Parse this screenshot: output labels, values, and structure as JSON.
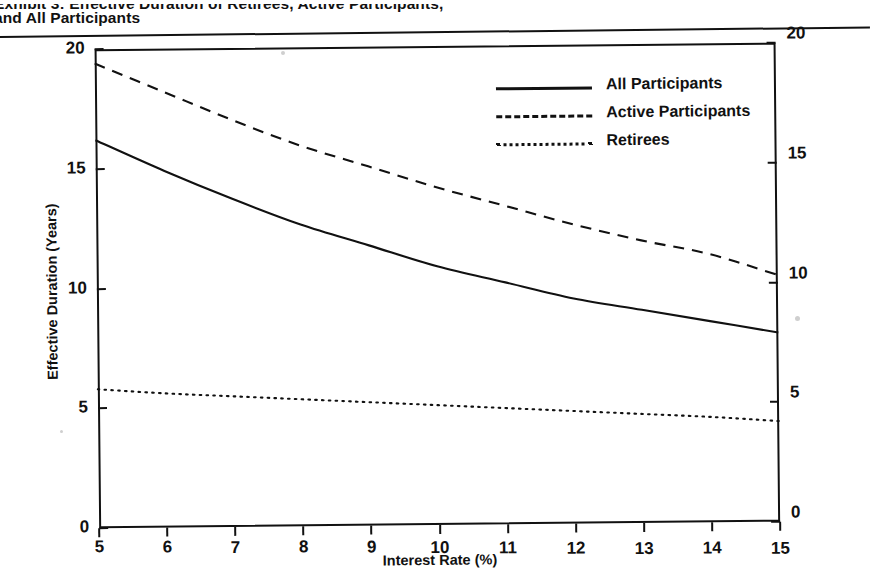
{
  "document": {
    "title_line1": "Exhibit 3: Effective Duration of Retirees, Active Participants,",
    "title_line2": "and All Participants"
  },
  "legend": {
    "position": "inside-top-right",
    "entries": [
      {
        "label": "All Participants",
        "style": "solid"
      },
      {
        "label": "Active Participants",
        "style": "dashed"
      },
      {
        "label": "Retirees",
        "style": "dotted"
      }
    ]
  },
  "axes": {
    "x": {
      "title": "Interest Rate (%)",
      "ticks": [
        "5",
        "6",
        "7",
        "8",
        "9",
        "10",
        "11",
        "12",
        "13",
        "14",
        "15"
      ],
      "min": 5,
      "max": 15
    },
    "y_left": {
      "title": "Effective Duration (Years)",
      "ticks": [
        "0",
        "5",
        "10",
        "15",
        "20"
      ],
      "min": 0,
      "max": 20
    },
    "y_right": {
      "ticks": [
        "0",
        "5",
        "10",
        "15",
        "20"
      ],
      "min": 0,
      "max": 20
    }
  },
  "colors": {
    "ink": "#111111",
    "paper": "#ffffff"
  },
  "chart_data": {
    "type": "line",
    "title": "Exhibit 3: Effective Duration of Retirees, Active Participants, and All Participants",
    "xlabel": "Interest Rate (%)",
    "ylabel": "Effective Duration (Years)",
    "xlim": [
      5,
      15
    ],
    "ylim": [
      0,
      20
    ],
    "xticks": [
      5,
      6,
      7,
      8,
      9,
      10,
      11,
      12,
      13,
      14,
      15
    ],
    "yticks": [
      0,
      5,
      10,
      15,
      20
    ],
    "grid": false,
    "legend_position": "upper right",
    "secondary_yaxis": {
      "ylim": [
        0,
        20
      ],
      "yticks": [
        0,
        5,
        10,
        15,
        20
      ]
    },
    "x": [
      5,
      6,
      7,
      8,
      9,
      10,
      11,
      12,
      13,
      14,
      15
    ],
    "series": [
      {
        "name": "All Participants",
        "style": "solid",
        "values": [
          16.2,
          14.9,
          13.7,
          12.6,
          11.7,
          10.8,
          10.1,
          9.4,
          8.9,
          8.4,
          7.9
        ]
      },
      {
        "name": "Active Participants",
        "style": "dashed",
        "values": [
          19.4,
          18.2,
          17.0,
          15.9,
          15.0,
          14.1,
          13.3,
          12.5,
          11.8,
          11.2,
          10.3
        ]
      },
      {
        "name": "Retirees",
        "style": "dotted",
        "values": [
          5.8,
          5.6,
          5.45,
          5.3,
          5.15,
          5.0,
          4.85,
          4.7,
          4.55,
          4.4,
          4.2
        ]
      }
    ]
  }
}
